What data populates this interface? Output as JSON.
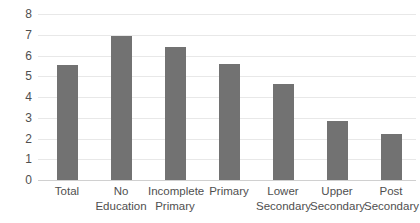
{
  "chart_data": {
    "type": "bar",
    "title": "",
    "subtitle": "",
    "xlabel": "",
    "ylabel": "",
    "ylim": [
      0,
      8
    ],
    "yticks": [
      "0",
      "1",
      "2",
      "3",
      "4",
      "5",
      "6",
      "7",
      "8"
    ],
    "grid": true,
    "legend": false,
    "legend_position": "none",
    "bar_color": "#727272",
    "gridline_color": "#e8e8e8",
    "categories": [
      "Total",
      "No Education",
      "Incomplete Primary",
      "Primary",
      "Lower Secondary",
      "Upper Secondary",
      "Post Secondary"
    ],
    "category_lines": [
      [
        "Total",
        ""
      ],
      [
        "No",
        "Education"
      ],
      [
        "Incomplete",
        "Primary"
      ],
      [
        "Primary",
        ""
      ],
      [
        "Lower",
        "Secondary"
      ],
      [
        "Upper",
        "Secondary"
      ],
      [
        "Post",
        "Secondary"
      ]
    ],
    "values": [
      5.55,
      6.95,
      6.4,
      5.6,
      4.65,
      2.85,
      2.2
    ]
  }
}
